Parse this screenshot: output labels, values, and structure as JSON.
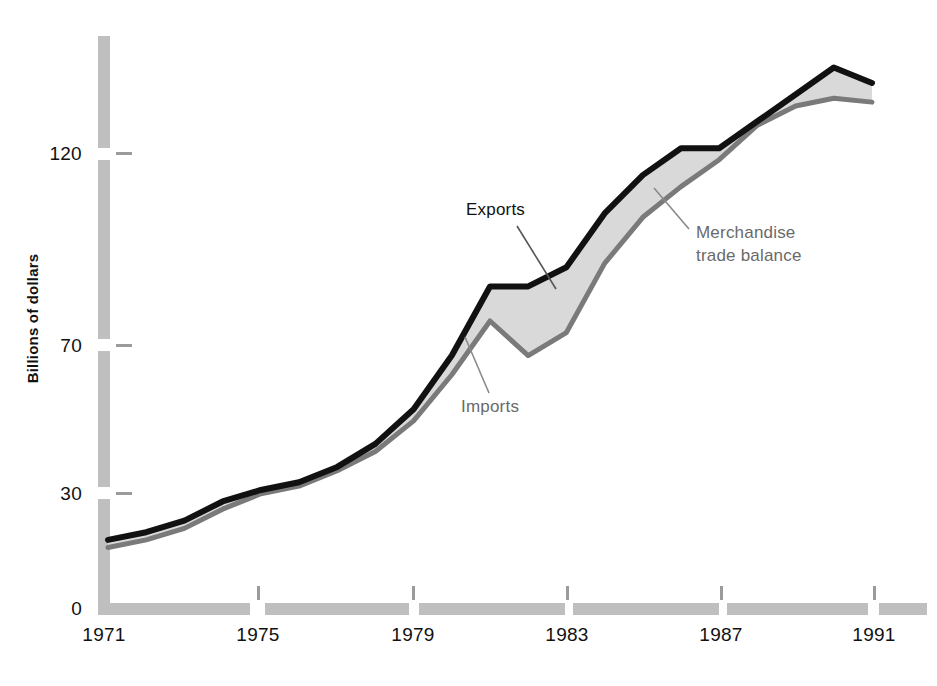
{
  "chart_data": {
    "type": "area",
    "title": "",
    "subtitle": "",
    "xlabel": "",
    "ylabel": "Billions of dollars",
    "xlim": [
      1971,
      1991
    ],
    "ylim": [
      0,
      145
    ],
    "grid": false,
    "legend_position": "inline-annotations",
    "x": [
      1971,
      1972,
      1973,
      1974,
      1975,
      1976,
      1977,
      1978,
      1979,
      1980,
      1981,
      1982,
      1983,
      1984,
      1985,
      1986,
      1987,
      1988,
      1989,
      1990,
      1991
    ],
    "series": [
      {
        "name": "Exports",
        "color": "#111111",
        "values": [
          18,
          20,
          23,
          28,
          31,
          33,
          37,
          43,
          52,
          66,
          84,
          84,
          89,
          103,
          113,
          120,
          120,
          127,
          134,
          141,
          137
        ]
      },
      {
        "name": "Imports",
        "color": "#7a7a7a",
        "values": [
          16,
          18,
          21,
          26,
          30,
          32,
          36,
          41,
          49,
          61,
          75,
          66,
          72,
          90,
          102,
          110,
          117,
          126,
          131,
          133,
          132
        ]
      }
    ],
    "band": {
      "name": "Merchandise trade balance",
      "fill": "#d9d9d9",
      "upper_series": "Exports",
      "lower_series": "Imports"
    },
    "annotations": [
      {
        "name": "exports-label",
        "text": "Exports",
        "color": "#111111"
      },
      {
        "name": "imports-label",
        "text": "Imports",
        "color": "#6a6a6a"
      },
      {
        "name": "balance-label-line1",
        "text": "Merchandise",
        "color": "#6a6a6a"
      },
      {
        "name": "balance-label-line2",
        "text": "trade balance",
        "color": "#6a6a6a"
      }
    ],
    "yticks": [
      {
        "value": 0,
        "label": "0"
      },
      {
        "value": 30,
        "label": "30"
      },
      {
        "value": 70,
        "label": "70"
      },
      {
        "value": 120,
        "label": "120"
      }
    ],
    "xticks": [
      {
        "value": 1971,
        "label": "1971"
      },
      {
        "value": 1975,
        "label": "1975"
      },
      {
        "value": 1979,
        "label": "1979"
      },
      {
        "value": 1983,
        "label": "1983"
      },
      {
        "value": 1987,
        "label": "1987"
      },
      {
        "value": 1991,
        "label": "1991"
      }
    ],
    "axis_style": {
      "axis_bar_color": "#bfbfbf",
      "axis_bar_thickness_px": 12,
      "background": "#ffffff"
    }
  },
  "axis": {
    "y_label": "Billions of dollars",
    "y_tick_0": "0",
    "y_tick_30": "30",
    "y_tick_70": "70",
    "y_tick_120": "120",
    "x_tick_1971": "1971",
    "x_tick_1975": "1975",
    "x_tick_1979": "1979",
    "x_tick_1983": "1983",
    "x_tick_1987": "1987",
    "x_tick_1991": "1991"
  },
  "labels": {
    "exports": "Exports",
    "imports": "Imports",
    "balance_line1": "Merchandise",
    "balance_line2": "trade balance"
  }
}
